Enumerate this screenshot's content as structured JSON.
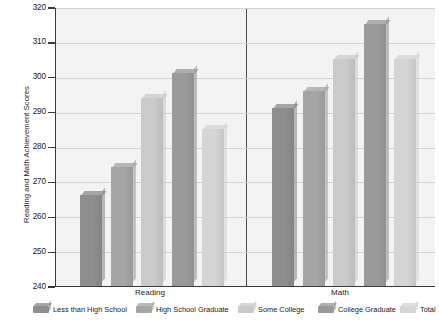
{
  "chart_data": {
    "type": "bar",
    "title": "",
    "xlabel": "",
    "ylabel": "Reading and Math Achievement Scores",
    "ylim": [
      240,
      320
    ],
    "ytick_step": 10,
    "yticks": [
      240,
      250,
      260,
      270,
      280,
      290,
      300,
      310,
      320
    ],
    "grid": true,
    "legend_position": "bottom",
    "categories": [
      "Reading",
      "Math"
    ],
    "series": [
      {
        "name": "Less than High School",
        "color": "#8e8e8e",
        "values": [
          266,
          291
        ]
      },
      {
        "name": "High School Graduate",
        "color": "#a5a5a5",
        "values": [
          274,
          296
        ]
      },
      {
        "name": "Some College",
        "color": "#cacaca",
        "values": [
          294,
          305
        ]
      },
      {
        "name": "College Graduate",
        "color": "#9a9a9a",
        "values": [
          301,
          315
        ]
      },
      {
        "name": "Total",
        "color": "#d5d5d5",
        "values": [
          285,
          305
        ]
      }
    ]
  },
  "axis": {
    "y_title": "Reading and Math Achievement Scores",
    "ticks": [
      "320",
      "310",
      "300",
      "290",
      "280",
      "270",
      "260",
      "250",
      "240"
    ]
  },
  "groups": [
    {
      "label": "Reading"
    },
    {
      "label": "Math"
    }
  ],
  "legend": {
    "items": [
      {
        "label": "Less than High School"
      },
      {
        "label": "High School Graduate"
      },
      {
        "label": "Some College"
      },
      {
        "label": "College Graduate"
      },
      {
        "label": "Total"
      }
    ]
  }
}
